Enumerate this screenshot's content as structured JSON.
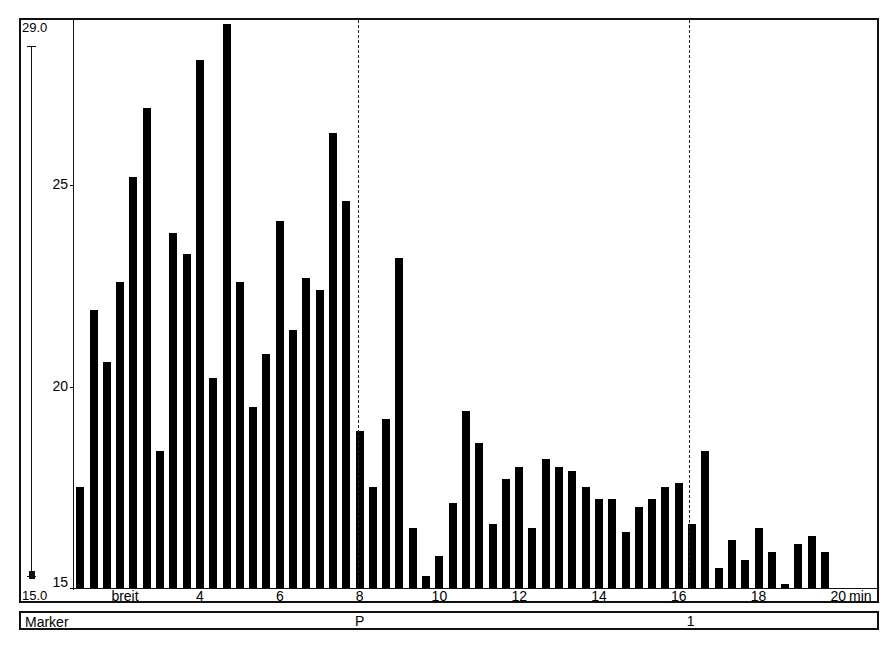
{
  "chart_data": {
    "type": "bar",
    "title": "",
    "xlabel": "min",
    "ylabel": "",
    "ylim": [
      15,
      29
    ],
    "y_scale_labels": {
      "max": "29.0",
      "min": "15.0"
    },
    "yticks": [
      15,
      20,
      25
    ],
    "xticks": [
      {
        "value": 4,
        "label": "4"
      },
      {
        "value": 6,
        "label": "6"
      },
      {
        "value": 8,
        "label": "8"
      },
      {
        "value": 10,
        "label": "10"
      },
      {
        "value": 12,
        "label": "12"
      },
      {
        "value": 14,
        "label": "14"
      },
      {
        "value": 16,
        "label": "16"
      },
      {
        "value": 18,
        "label": "18"
      },
      {
        "value": 20,
        "label": "20"
      }
    ],
    "x_unit": "min",
    "x_annotation": {
      "text": "breit",
      "x": 2.3
    },
    "xlim": [
      0.1,
      20.1
    ],
    "bar_interval_min": 0.3333,
    "x_start": 1.0,
    "values": [
      17.5,
      21.9,
      20.6,
      22.6,
      25.2,
      26.9,
      18.4,
      23.8,
      23.3,
      28.1,
      20.2,
      29.0,
      22.6,
      19.5,
      20.8,
      24.1,
      21.4,
      22.7,
      22.4,
      26.3,
      24.6,
      18.9,
      17.5,
      19.2,
      23.2,
      16.5,
      15.3,
      15.8,
      17.1,
      19.4,
      18.6,
      16.6,
      17.7,
      18.0,
      16.5,
      18.2,
      18.0,
      17.9,
      17.5,
      17.2,
      17.2,
      16.4,
      17.0,
      17.2,
      17.5,
      17.6,
      16.6,
      18.4,
      15.5,
      16.2,
      15.7,
      16.5,
      15.9,
      15.1,
      16.1,
      16.3,
      15.9
    ],
    "reference_lines": [
      {
        "x": 7.95,
        "style": "dashed",
        "marker": "P"
      },
      {
        "x": 16.25,
        "style": "dashed",
        "marker": "1"
      }
    ],
    "grid": false,
    "legend": null
  },
  "marker_row": {
    "label": "Marker",
    "markers": [
      {
        "text": "P",
        "x": 7.95
      },
      {
        "text": "1",
        "x": 16.25
      }
    ]
  }
}
